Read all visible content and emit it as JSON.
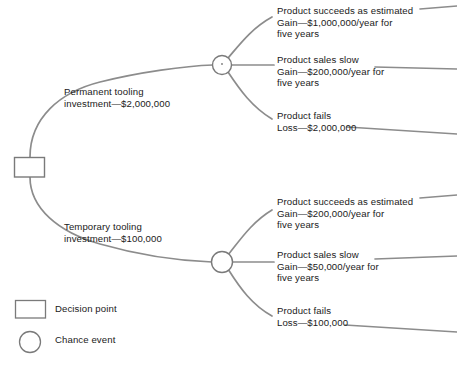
{
  "diagram": {
    "type": "decision-tree",
    "line_color": "#8c8c8c",
    "text_color": "#1a1a1a",
    "background": "#ffffff"
  },
  "root": {
    "node_type": "decision-point",
    "shape": "rectangle"
  },
  "branches": [
    {
      "id": "permanent-tooling",
      "label_line1": "Permanent tooling",
      "label_line2": "investment—$2,000,000",
      "chance_node": "chance-event",
      "outcomes": [
        {
          "id": "permanent-succeeds",
          "line1": "Product succeeds as estimated",
          "line2": "Gain—$1,000,000/year for",
          "line3": "five years"
        },
        {
          "id": "permanent-slow",
          "line1": "Product sales slow",
          "line2": "Gain—$200,000/year for",
          "line3": "five years"
        },
        {
          "id": "permanent-fails",
          "line1": "Product fails",
          "line2": "Loss—$2,000,000",
          "line3": ""
        }
      ]
    },
    {
      "id": "temporary-tooling",
      "label_line1": "Temporary tooling",
      "label_line2": "investment—$100,000",
      "chance_node": "chance-event",
      "outcomes": [
        {
          "id": "temporary-succeeds",
          "line1": "Product succeeds as estimated",
          "line2": "Gain—$200,000/year for",
          "line3": "five years"
        },
        {
          "id": "temporary-slow",
          "line1": "Product sales slow",
          "line2": "Gain—$50,000/year for",
          "line3": "five years"
        },
        {
          "id": "temporary-fails",
          "line1": "Product fails",
          "line2": "Loss—$100,000",
          "line3": ""
        }
      ]
    }
  ],
  "legend": {
    "items": [
      {
        "symbol": "rectangle",
        "label": "Decision point"
      },
      {
        "symbol": "circle",
        "label": "Chance event"
      }
    ]
  }
}
